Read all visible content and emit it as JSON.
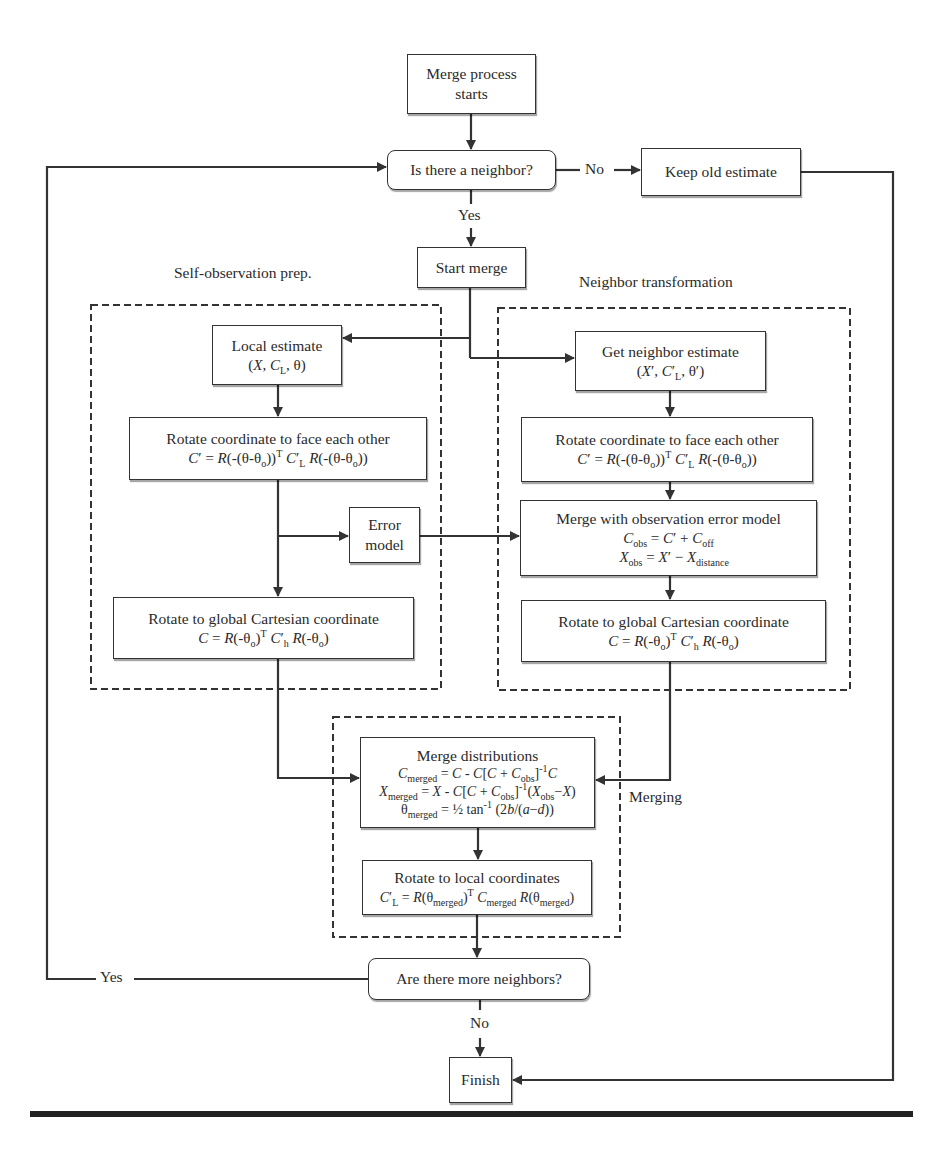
{
  "diagram": {
    "type": "flowchart",
    "nodes": {
      "start": {
        "label": "Merge process starts",
        "line1": "Merge process",
        "line2": "starts"
      },
      "neighbor_check": {
        "label": "Is there a neighbor?"
      },
      "keep_old": {
        "label": "Keep old estimate"
      },
      "start_merge": {
        "label": "Start merge"
      },
      "local_estimate": {
        "title": "Local estimate",
        "formula": "(X, C_L, θ)"
      },
      "self_rotate_face": {
        "title": "Rotate coordinate to face each other",
        "formula": "C′ = R(-(θ-θo))^T C′L R(-(θ-θo))"
      },
      "error_model": {
        "line1": "Error",
        "line2": "model"
      },
      "self_rotate_global": {
        "title": "Rotate to global Cartesian coordinate",
        "formula": "C = R(-θo)^T C′h R(-θo)"
      },
      "get_neighbor": {
        "title": "Get neighbor estimate",
        "formula": "(X′, C′L, θ′)"
      },
      "nb_rotate_face": {
        "title": "Rotate coordinate to face each other",
        "formula": "C′ = R(-(θ-θo))^T C′L R(-(θ-θo))"
      },
      "merge_obs": {
        "title": "Merge with observation error model",
        "formula1": "Cobs = C′ + Coff",
        "formula2": "Xobs = X′ − Xdistance"
      },
      "nb_rotate_global": {
        "title": "Rotate to global Cartesian coordinate",
        "formula": "C = R(-θo)^T C′h R(-θo)"
      },
      "merge_dist": {
        "title": "Merge distributions",
        "formula1": "Cmerged = C - C[C + Cobs]^-1 C",
        "formula2": "Xmerged = X - C[C + Cobs]^-1 (Xobs − X)",
        "formula3": "θmerged = ½ tan^-1 (2b/(a−d))"
      },
      "rotate_local": {
        "title": "Rotate to local coordinates",
        "formula": "C′L = R(θmerged)^T Cmerged R(θmerged)"
      },
      "more_neighbors": {
        "label": "Are there more neighbors?"
      },
      "finish": {
        "label": "Finish"
      }
    },
    "groups": {
      "self_obs": "Self-observation prep.",
      "neighbor_transform": "Neighbor transformation",
      "merging": "Merging"
    },
    "edge_labels": {
      "neighbor_no": "No",
      "neighbor_yes": "Yes",
      "more_yes": "Yes",
      "more_no": "No"
    }
  }
}
